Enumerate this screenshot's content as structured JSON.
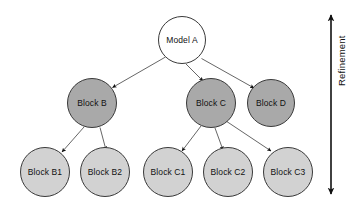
{
  "diagram": {
    "type": "tree",
    "title": "",
    "background_color": "#ffffff",
    "levels": [
      {
        "level": 1,
        "fill_color": "#ffffff",
        "nodes": [
          {
            "id": "model-a",
            "label": "Model A",
            "cx": 182,
            "cy": 40,
            "r": 24
          }
        ]
      },
      {
        "level": 2,
        "fill_color": "#a9a9a9",
        "nodes": [
          {
            "id": "block-b",
            "label": "Block B",
            "cx": 92,
            "cy": 103,
            "r": 25
          },
          {
            "id": "block-c",
            "label": "Block C",
            "cx": 211,
            "cy": 103,
            "r": 25
          },
          {
            "id": "block-d",
            "label": "Block D",
            "cx": 271,
            "cy": 103,
            "r": 24
          }
        ]
      },
      {
        "level": 3,
        "fill_color": "#d2d2d2",
        "nodes": [
          {
            "id": "block-b1",
            "label": "Block B1",
            "cx": 45,
            "cy": 172,
            "r": 25
          },
          {
            "id": "block-b2",
            "label": "Block B2",
            "cx": 105,
            "cy": 172,
            "r": 25
          },
          {
            "id": "block-c1",
            "label": "Block C1",
            "cx": 168,
            "cy": 172,
            "r": 25
          },
          {
            "id": "block-c2",
            "label": "Block C2",
            "cx": 228,
            "cy": 172,
            "r": 25
          },
          {
            "id": "block-c3",
            "label": "Block C3",
            "cx": 288,
            "cy": 172,
            "r": 25
          }
        ]
      }
    ],
    "edges": [
      {
        "id": "edge-model-a-block-b",
        "from": "model-a",
        "to": "block-b"
      },
      {
        "id": "edge-model-a-block-c",
        "from": "model-a",
        "to": "block-c"
      },
      {
        "id": "edge-model-a-block-d",
        "from": "model-a",
        "to": "block-d"
      },
      {
        "id": "edge-block-b-block-b1",
        "from": "block-b",
        "to": "block-b1"
      },
      {
        "id": "edge-block-b-block-b2",
        "from": "block-b",
        "to": "block-b2"
      },
      {
        "id": "edge-block-c-block-c1",
        "from": "block-c",
        "to": "block-c1"
      },
      {
        "id": "edge-block-c-block-c2",
        "from": "block-c",
        "to": "block-c2"
      },
      {
        "id": "edge-block-c-block-c3",
        "from": "block-c",
        "to": "block-c3"
      }
    ],
    "edge_color": "#555555",
    "arrowhead_color": "#111111",
    "node_border_color": "#3a3a3a",
    "label_color": "#111111"
  },
  "axis": {
    "label": "Refinement",
    "orientation": "vertical",
    "direction": "downward",
    "color": "#111111",
    "icon": "down-arrow-icon"
  }
}
